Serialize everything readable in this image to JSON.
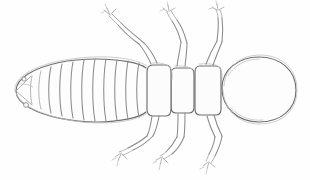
{
  "image": {
    "title": "Pencil sketch of an insect, dorsal view",
    "subject": "termite-like insect",
    "medium": "graphite pencil line drawing",
    "orientation": "head at right, abdomen at left",
    "background_color": "#fefefe",
    "line_color": "#8a8a8a",
    "dark_line_color": "#6f6f6f",
    "faint_line_color": "#c2c2c2",
    "width": 310,
    "height": 180
  },
  "anatomy": {
    "head": {
      "label": "head",
      "shape": "large rounded oval",
      "center_x": 258,
      "center_y": 90,
      "radius_x": 38,
      "radius_y": 32,
      "outline_style": "doubled sketchy contour"
    },
    "thorax": {
      "label": "thorax",
      "segment_count": 3,
      "segments": [
        {
          "name": "prothorax",
          "x": 197,
          "y": 66,
          "width": 24,
          "height": 48
        },
        {
          "name": "mesothorax",
          "x": 172,
          "y": 68,
          "width": 22,
          "height": 44
        },
        {
          "name": "metathorax",
          "x": 148,
          "y": 65,
          "width": 23,
          "height": 50
        }
      ]
    },
    "abdomen": {
      "label": "abdomen",
      "segment_count": 10,
      "tip_x": 16,
      "tip_y": 90,
      "widest_y_top": 62,
      "widest_y_bottom": 120,
      "cerci": [
        {
          "name": "cercus-upper",
          "cx": 24,
          "cy": 79,
          "r": 2.1
        },
        {
          "name": "cercus-lower",
          "cx": 26,
          "cy": 105,
          "r": 2.3
        }
      ]
    },
    "legs": {
      "label": "legs",
      "count": 6,
      "upper": [
        {
          "name": "foreleg-left-upper",
          "attach_x": 152,
          "attach_y": 64,
          "direction": "up-left"
        },
        {
          "name": "midleg-left-upper",
          "attach_x": 178,
          "attach_y": 66,
          "direction": "up"
        },
        {
          "name": "hindleg-left-upper",
          "attach_x": 208,
          "attach_y": 64,
          "direction": "up-right"
        }
      ],
      "lower": [
        {
          "name": "foreleg-right-lower",
          "attach_x": 154,
          "attach_y": 116,
          "direction": "down-left"
        },
        {
          "name": "midleg-right-lower",
          "attach_x": 180,
          "attach_y": 114,
          "direction": "down"
        },
        {
          "name": "hindleg-right-lower",
          "attach_x": 212,
          "attach_y": 116,
          "direction": "down-right"
        }
      ],
      "joints": [
        "coxa",
        "femur",
        "tibia",
        "tarsus",
        "claw"
      ],
      "claw_style": "small forked tarsal claw"
    }
  }
}
